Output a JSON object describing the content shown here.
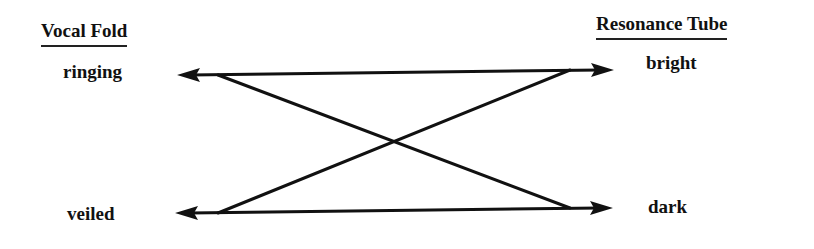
{
  "diagram": {
    "left_column": {
      "header": "Vocal Fold",
      "items": [
        "ringing",
        "veiled"
      ]
    },
    "right_column": {
      "header": "Resonance Tube",
      "items": [
        "bright",
        "dark"
      ]
    },
    "connections": [
      {
        "from": "ringing",
        "to": "bright",
        "type": "bidirectional-horizontal"
      },
      {
        "from": "veiled",
        "to": "dark",
        "type": "bidirectional-horizontal"
      },
      {
        "from": "ringing",
        "to": "dark",
        "type": "diagonal"
      },
      {
        "from": "veiled",
        "to": "bright",
        "type": "diagonal"
      }
    ],
    "colors": {
      "line": "#111111",
      "background": "#ffffff"
    }
  }
}
